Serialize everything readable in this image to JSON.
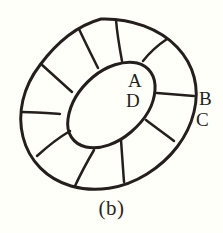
{
  "figure": {
    "caption": "(b)",
    "labels": [
      {
        "id": "A",
        "text": "A",
        "position": "inside-inner-ellipse-upper-right"
      },
      {
        "id": "D",
        "text": "D",
        "position": "inside-inner-ellipse-lower-right"
      },
      {
        "id": "B",
        "text": "B",
        "position": "outside-outer-ellipse-right-upper"
      },
      {
        "id": "C",
        "text": "C",
        "position": "outside-outer-ellipse-right-lower"
      }
    ],
    "colors": {
      "background": "#fffffa",
      "ink": "#241f1c",
      "caption_ink": "#2b2522"
    },
    "geometry": {
      "outer_ellipse": {
        "cx": 109,
        "cy": 105,
        "rx": 90,
        "ry": 62,
        "rotation_deg": -28
      },
      "inner_ellipse": {
        "cx": 110,
        "cy": 105,
        "rx": 49,
        "ry": 26,
        "rotation_deg": -28
      },
      "segment_count": 10,
      "stroke_width": 2.6
    }
  }
}
